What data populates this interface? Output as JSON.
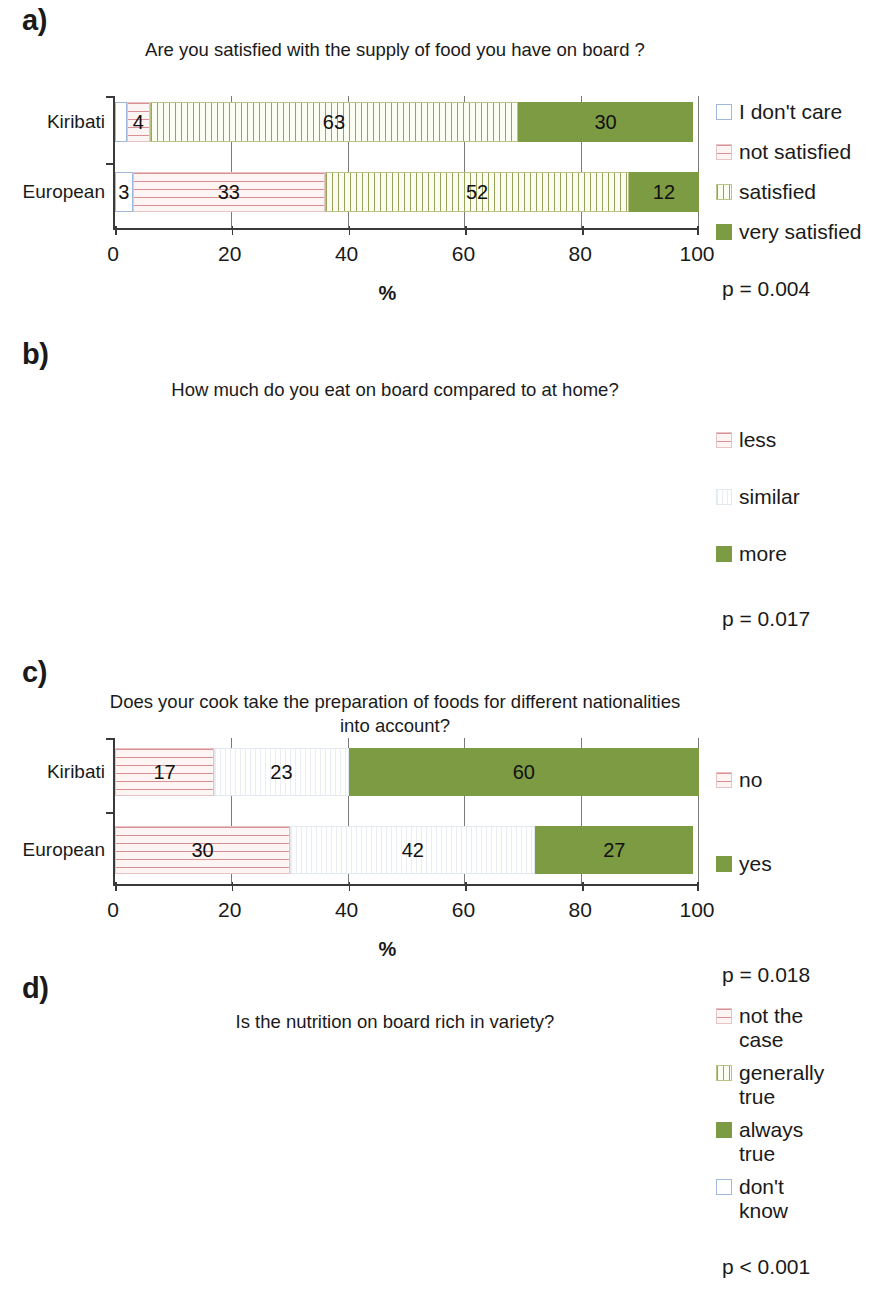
{
  "figure": {
    "axis_title": "%",
    "categories": [
      "Kiribati",
      "European"
    ],
    "x_ticks": [
      "0",
      "20",
      "40",
      "60",
      "80",
      "100"
    ],
    "xlim": [
      0,
      100
    ]
  },
  "colors": {
    "green_solid": "#7d9b43",
    "pink_lines": "#d98f93",
    "olive_lines": "#97a55a",
    "blue_outline": "#9fb8dc",
    "faint_grey": "#e9eef4",
    "axis": "#3a3a3a",
    "gridline": "#7a7a7a"
  },
  "panels": [
    {
      "label": "a)",
      "title": "Are you satisfied with the supply of food you have on board ?",
      "pvalue": "p = 0.004",
      "legend": [
        {
          "name": "i-dont-care",
          "text": "I don't care",
          "pattern": "p-blank"
        },
        {
          "name": "not-satisfied",
          "text": "not satisfied",
          "pattern": "p-pinkh"
        },
        {
          "name": "satisfied",
          "text": "satisfied",
          "pattern": "p-olivev"
        },
        {
          "name": "very-satisfied",
          "text": "very satisfied",
          "pattern": "p-solid"
        }
      ],
      "chart_data": {
        "type": "bar",
        "orientation": "horizontal",
        "stacked": true,
        "title": "Are you satisfied with the supply of food you have on board ?",
        "xlabel": "%",
        "ylabel": "",
        "xlim": [
          0,
          100
        ],
        "xticks": [
          0,
          20,
          40,
          60,
          80,
          100
        ],
        "grid": true,
        "legend_position": "right",
        "categories": [
          "Kiribati",
          "European"
        ],
        "series": [
          {
            "name": "I don't care",
            "values": [
              2,
              3
            ]
          },
          {
            "name": "not satisfied",
            "values": [
              4,
              33
            ]
          },
          {
            "name": "satisfied",
            "values": [
              63,
              52
            ]
          },
          {
            "name": "very satisfied",
            "values": [
              30,
              12
            ]
          }
        ],
        "annotation": "p = 0.004"
      }
    },
    {
      "label": "b)",
      "title": "How much do you eat on board compared to at home?",
      "pvalue": "p = 0.017",
      "legend": [
        {
          "name": "less",
          "text": "less",
          "pattern": "p-pinkh"
        },
        {
          "name": "similar",
          "text": "similar",
          "pattern": "p-faint"
        },
        {
          "name": "more",
          "text": "more",
          "pattern": "p-solid"
        }
      ],
      "chart_data": {
        "type": "bar",
        "orientation": "horizontal",
        "stacked": true,
        "title": "How much do you eat on board compared to at home?",
        "xlabel": "%",
        "ylabel": "",
        "xlim": [
          0,
          100
        ],
        "xticks": [
          0,
          20,
          40,
          60,
          80,
          100
        ],
        "grid": true,
        "legend_position": "right",
        "categories": [
          "Kiribati",
          "European"
        ],
        "series": [
          {
            "name": "less",
            "values": [
              17,
              30
            ]
          },
          {
            "name": "similar",
            "values": [
              23,
              42
            ]
          },
          {
            "name": "more",
            "values": [
              60,
              27
            ]
          }
        ],
        "annotation": "p = 0.017"
      }
    },
    {
      "label": "c)",
      "title": "Does your cook take the preparation of foods for different nationalities into account?",
      "pvalue": "p = 0.018",
      "legend": [
        {
          "name": "no",
          "text": "no",
          "pattern": "p-pinkh"
        },
        {
          "name": "yes",
          "text": "yes",
          "pattern": "p-solid"
        }
      ],
      "chart_data": {
        "type": "bar",
        "orientation": "horizontal",
        "stacked": true,
        "title": "Does your cook take the preparation of foods for different nationalities into account?",
        "xlabel": "%",
        "ylabel": "",
        "xlim": [
          0,
          100
        ],
        "xticks": [
          0,
          20,
          40,
          60,
          80,
          100
        ],
        "grid": true,
        "legend_position": "right",
        "categories": [
          "Kiribati",
          "European"
        ],
        "series": [
          {
            "name": "no",
            "values": [
              60,
              33
            ]
          },
          {
            "name": "yes",
            "values": [
              40,
              67
            ]
          }
        ],
        "annotation": "p = 0.018"
      }
    },
    {
      "label": "d)",
      "title": "Is the nutrition on board rich in variety?",
      "pvalue": "p < 0.001",
      "legend": [
        {
          "name": "not-the-case",
          "text": "not the\ncase",
          "pattern": "p-pinkh"
        },
        {
          "name": "generally-true",
          "text": "generally\ntrue",
          "pattern": "p-olivev"
        },
        {
          "name": "always-true",
          "text": "always\ntrue",
          "pattern": "p-solid"
        },
        {
          "name": "dont-know",
          "text": "don't\nknow",
          "pattern": "p-blank"
        }
      ],
      "chart_data": {
        "type": "bar",
        "orientation": "horizontal",
        "stacked": true,
        "title": "Is the nutrition on board rich in variety?",
        "xlabel": "%",
        "ylabel": "",
        "xlim": [
          0,
          100
        ],
        "xticks": [
          0,
          20,
          40,
          60,
          80,
          100
        ],
        "grid": true,
        "legend_position": "right",
        "categories": [
          "Kiribati",
          "European"
        ],
        "series": [
          {
            "name": "not the case",
            "values": [
              4,
              24
            ]
          },
          {
            "name": "generally true",
            "values": [
              20,
              46
            ]
          },
          {
            "name": "always true",
            "values": [
              4,
              15
            ]
          },
          {
            "name": "don't know",
            "values": [
              72,
              15
            ]
          }
        ],
        "annotation": "p < 0.001"
      }
    }
  ]
}
